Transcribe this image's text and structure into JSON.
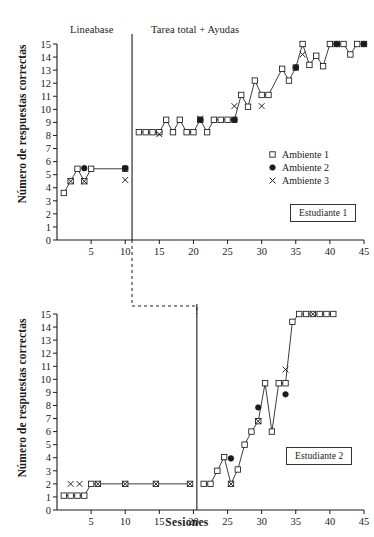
{
  "figure": {
    "ylabel": "Número de respuestas correctas",
    "xlabel": "Sesiones",
    "phase_labels": {
      "baseline": "Lineabase",
      "intervention": "Tarea total + Ayudas"
    },
    "legend": [
      {
        "key": "open-square",
        "label": "Ambiente 1"
      },
      {
        "key": "filled-circle",
        "label": "Ambiente 2"
      },
      {
        "key": "cross",
        "label": "Ambiente 3"
      }
    ],
    "panel_labels": {
      "top": "Estudiante 1",
      "bottom": "Estudiante 2"
    },
    "colors": {
      "axis": "#1a1a1a",
      "marker_stroke": "#1a1a1a",
      "marker_fill": "#ffffff",
      "filled_marker": "#1a1a1a",
      "line": "#1a1a1a"
    },
    "y_ticks": [
      0,
      1,
      2,
      3,
      4,
      5,
      6,
      7,
      8,
      9,
      10,
      11,
      12,
      13,
      14,
      15
    ],
    "x_ticks": [
      5,
      10,
      15,
      20,
      25,
      30,
      35,
      40,
      45
    ]
  },
  "chart_data": [
    {
      "type": "line",
      "title": "Estudiante 1",
      "xlabel": "Sesiones",
      "ylabel": "Número de respuestas correctas",
      "xlim": [
        0,
        45
      ],
      "ylim": [
        0,
        15
      ],
      "grid": false,
      "legend_position": "center-right",
      "phase_change_x": 11,
      "annotations": [
        {
          "text": "Lineabase",
          "x": 5.5,
          "y": 16.2
        },
        {
          "text": "Tarea total + Ayudas",
          "x": 22,
          "y": 16.2
        }
      ],
      "series": [
        {
          "name": "Ambiente 1",
          "marker": "open-square",
          "connected": true,
          "points": [
            {
              "x": 1,
              "y": 3.6
            },
            {
              "x": 2,
              "y": 4.5
            },
            {
              "x": 3,
              "y": 5.45
            },
            {
              "x": 4,
              "y": 4.5
            },
            {
              "x": 5,
              "y": 5.45
            },
            {
              "x": 10,
              "y": 5.45
            },
            {
              "x": 12,
              "y": 8.25
            },
            {
              "x": 13,
              "y": 8.25
            },
            {
              "x": 14,
              "y": 8.25
            },
            {
              "x": 15,
              "y": 8.25
            },
            {
              "x": 16,
              "y": 9.2
            },
            {
              "x": 17,
              "y": 8.25
            },
            {
              "x": 18,
              "y": 9.2
            },
            {
              "x": 19,
              "y": 8.25
            },
            {
              "x": 20,
              "y": 8.25
            },
            {
              "x": 21,
              "y": 9.2
            },
            {
              "x": 22,
              "y": 8.25
            },
            {
              "x": 23,
              "y": 9.2
            },
            {
              "x": 24,
              "y": 9.2
            },
            {
              "x": 25,
              "y": 9.2
            },
            {
              "x": 26,
              "y": 9.2
            },
            {
              "x": 27,
              "y": 11.1
            },
            {
              "x": 28,
              "y": 10.2
            },
            {
              "x": 29,
              "y": 12.2
            },
            {
              "x": 30,
              "y": 11.1
            },
            {
              "x": 31,
              "y": 11.1
            },
            {
              "x": 33,
              "y": 13.1
            },
            {
              "x": 34,
              "y": 12.2
            },
            {
              "x": 35,
              "y": 13.2
            },
            {
              "x": 36,
              "y": 15.0
            },
            {
              "x": 37,
              "y": 13.4
            },
            {
              "x": 38,
              "y": 14.1
            },
            {
              "x": 39,
              "y": 13.3
            },
            {
              "x": 40,
              "y": 15.0
            },
            {
              "x": 41,
              "y": 15.0
            },
            {
              "x": 42,
              "y": 15.0
            },
            {
              "x": 43,
              "y": 14.2
            },
            {
              "x": 44,
              "y": 15.0
            },
            {
              "x": 45,
              "y": 15.0
            }
          ]
        },
        {
          "name": "Ambiente 2",
          "marker": "filled-circle",
          "connected": false,
          "points": [
            {
              "x": 4,
              "y": 5.5
            },
            {
              "x": 10,
              "y": 5.5
            },
            {
              "x": 21,
              "y": 9.2
            },
            {
              "x": 26,
              "y": 9.2
            },
            {
              "x": 35,
              "y": 13.2
            },
            {
              "x": 41,
              "y": 15.0
            },
            {
              "x": 45,
              "y": 15.0
            }
          ]
        },
        {
          "name": "Ambiente 3",
          "marker": "cross",
          "connected": false,
          "points": [
            {
              "x": 2,
              "y": 4.5
            },
            {
              "x": 4,
              "y": 4.5
            },
            {
              "x": 10,
              "y": 4.6
            },
            {
              "x": 15,
              "y": 8.1
            },
            {
              "x": 21,
              "y": 9.3
            },
            {
              "x": 26,
              "y": 10.25
            },
            {
              "x": 30,
              "y": 10.25
            },
            {
              "x": 36,
              "y": 14.2
            },
            {
              "x": 41,
              "y": 15.0
            },
            {
              "x": 45,
              "y": 15.0
            }
          ]
        }
      ]
    },
    {
      "type": "line",
      "title": "Estudiante 2",
      "xlabel": "Sesiones",
      "ylabel": "Número de respuestas correctas",
      "xlim": [
        0,
        45
      ],
      "ylim": [
        0,
        15
      ],
      "grid": false,
      "legend_position": "none",
      "phase_change_x": 20.5,
      "series": [
        {
          "name": "Ambiente 1",
          "marker": "open-square",
          "connected": true,
          "points": [
            {
              "x": 1,
              "y": 1.1
            },
            {
              "x": 2,
              "y": 1.1
            },
            {
              "x": 3,
              "y": 1.1
            },
            {
              "x": 4,
              "y": 1.1
            },
            {
              "x": 5,
              "y": 2.0
            },
            {
              "x": 6,
              "y": 2.0
            },
            {
              "x": 10,
              "y": 2.0
            },
            {
              "x": 14.5,
              "y": 2.0
            },
            {
              "x": 19.5,
              "y": 2.0
            },
            {
              "x": 21.5,
              "y": 2.0
            },
            {
              "x": 22.5,
              "y": 2.0
            },
            {
              "x": 23.5,
              "y": 3.0
            },
            {
              "x": 24.5,
              "y": 4.05
            },
            {
              "x": 25.5,
              "y": 2.0
            },
            {
              "x": 26.5,
              "y": 3.1
            },
            {
              "x": 27.5,
              "y": 5.0
            },
            {
              "x": 28.5,
              "y": 6.0
            },
            {
              "x": 29.5,
              "y": 6.8
            },
            {
              "x": 30.5,
              "y": 9.7
            },
            {
              "x": 31.5,
              "y": 6.0
            },
            {
              "x": 32.5,
              "y": 9.7
            },
            {
              "x": 33.5,
              "y": 9.7
            },
            {
              "x": 34.5,
              "y": 14.4
            },
            {
              "x": 35.5,
              "y": 15.0
            },
            {
              "x": 36.5,
              "y": 15.0
            },
            {
              "x": 37.5,
              "y": 15.0
            },
            {
              "x": 38.5,
              "y": 15.0
            },
            {
              "x": 39.5,
              "y": 15.0
            },
            {
              "x": 40.5,
              "y": 15.0
            }
          ]
        },
        {
          "name": "Ambiente 2",
          "marker": "filled-circle",
          "connected": false,
          "points": [
            {
              "x": 25.5,
              "y": 3.95
            },
            {
              "x": 29.5,
              "y": 7.85
            },
            {
              "x": 33.5,
              "y": 8.85
            }
          ]
        },
        {
          "name": "Ambiente 3",
          "marker": "cross",
          "connected": false,
          "points": [
            {
              "x": 2,
              "y": 2.0
            },
            {
              "x": 3.3,
              "y": 2.0
            },
            {
              "x": 6,
              "y": 2.0
            },
            {
              "x": 10,
              "y": 2.0
            },
            {
              "x": 14.5,
              "y": 2.0
            },
            {
              "x": 19.5,
              "y": 2.0
            },
            {
              "x": 25.5,
              "y": 2.0
            },
            {
              "x": 29.5,
              "y": 6.8
            },
            {
              "x": 33.5,
              "y": 10.75
            },
            {
              "x": 37.5,
              "y": 15.0
            }
          ]
        }
      ]
    }
  ]
}
